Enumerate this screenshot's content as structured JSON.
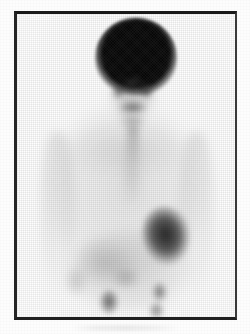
{
  "figure": {
    "modality": "scintigraphy",
    "view": "anterior",
    "body_region": "head, neck, chest and abdomen",
    "colormap": "grayscale",
    "caption": "",
    "frame_color": "#1a1a1a",
    "background_color": "#ffffff"
  },
  "regions": {
    "head": {
      "label": "head-brain-uptake",
      "intensity": "very high",
      "tone": "#070707"
    },
    "nasal": {
      "label": "nasal-sinus-focus",
      "intensity": "moderate",
      "tone": "#3c3c3c"
    },
    "salivary_left": {
      "label": "left-salivary-gland-focus",
      "intensity": "moderate",
      "tone": "#373737"
    },
    "salivary_right": {
      "label": "right-salivary-gland-focus",
      "intensity": "moderate",
      "tone": "#373737"
    },
    "oral": {
      "label": "oral-oropharyngeal-band",
      "intensity": "moderate",
      "tone": "#3a3a3a"
    },
    "thyroid": {
      "label": "thyroid-neck-focus",
      "intensity": "low-moderate",
      "tone": "#555555"
    },
    "mediastinum": {
      "label": "mediastinum-soft-tissue",
      "intensity": "low",
      "tone": "#696969"
    },
    "cardiac": {
      "label": "cardiac-blood-pool",
      "intensity": "high",
      "tone": "#303030"
    },
    "liver": {
      "label": "liver-upper-abdomen",
      "intensity": "low",
      "tone": "#6c6c6c"
    },
    "bowel": {
      "label": "bowel-midabdomen",
      "intensity": "low",
      "tone": "#646464"
    },
    "pelvic_left": {
      "label": "left-pelvic-focus",
      "intensity": "moderate-high",
      "tone": "#343434"
    },
    "pelvic_right": {
      "label": "right-pelvic-focus",
      "intensity": "moderate",
      "tone": "#3e3e3e"
    },
    "arm_left": {
      "label": "left-arm-soft-tissue",
      "intensity": "very low",
      "tone": "#7d7d7d"
    },
    "arm_right": {
      "label": "right-arm-soft-tissue",
      "intensity": "very low",
      "tone": "#7d7d7d"
    }
  }
}
